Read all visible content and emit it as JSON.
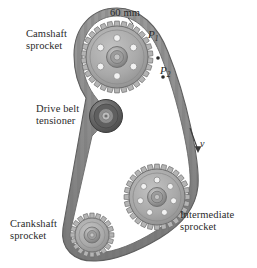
{
  "figure": {
    "background_color": "#ffffff",
    "belt_color": "#8f8f8f",
    "sprocket_body_color": "#a8a8a8",
    "sprocket_edge_color": "#6b6b6b",
    "tensioner_color": "#6e6e6e",
    "label_color": "#2a2a2a"
  },
  "labels": {
    "camshaft": "Camshaft\nsprocket",
    "tensioner": "Drive belt\ntensioner",
    "crankshaft": "Crankshaft\nsprocket",
    "intermediate": "Intermediate\nsprocket",
    "dimension_60mm": "60 mm",
    "point_p1_base": "P",
    "point_p1_sub": "1",
    "point_p2_base": "P",
    "point_p2_sub": "2",
    "velocity": "v"
  },
  "components": {
    "camshaft_sprocket": {
      "name": "camshaft-sprocket",
      "cx": 117,
      "cy": 57,
      "radius": 36,
      "teeth": 30,
      "hole_count": 6,
      "hub_radius": 9
    },
    "tensioner_pulley": {
      "name": "drive-belt-tensioner",
      "cx": 106,
      "cy": 116,
      "radius": 16,
      "hub_radius": 7
    },
    "crankshaft_sprocket": {
      "name": "crankshaft-sprocket",
      "cx": 92,
      "cy": 235,
      "radius": 22,
      "teeth": 20,
      "hole_count": 0,
      "hub_radius": 7
    },
    "intermediate_sprocket": {
      "name": "intermediate-sprocket",
      "cx": 157,
      "cy": 197,
      "radius": 33,
      "teeth": 28,
      "hole_count": 7,
      "hub_radius": 8
    }
  },
  "annotations": {
    "velocity_arrow": {
      "x1": 190,
      "y1": 128,
      "x2": 198,
      "y2": 152
    },
    "dimension_leader": {
      "x1": 128,
      "y1": 18,
      "x2": 133,
      "y2": 24
    }
  }
}
